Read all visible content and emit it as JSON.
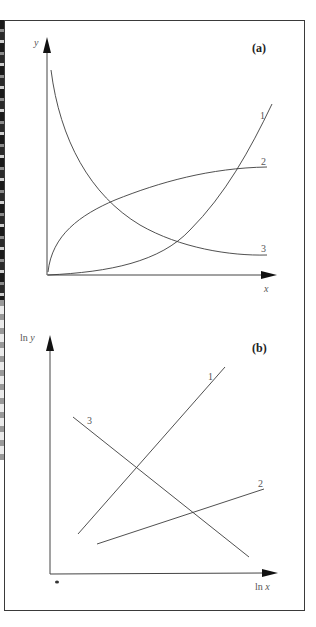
{
  "figure": {
    "panel_a": {
      "label": "(a)",
      "y_axis_label": "y",
      "x_axis_label": "x",
      "curves": [
        {
          "id": "1",
          "label": "1",
          "shape": "exponential growth (concave up)"
        },
        {
          "id": "2",
          "label": "2",
          "shape": "saturating growth (concave down, levels off)"
        },
        {
          "id": "3",
          "label": "3",
          "shape": "decay (concave up, decreasing)"
        }
      ]
    },
    "panel_b": {
      "label": "(b)",
      "y_axis_label": "ln y",
      "x_axis_label": "ln x",
      "lines": [
        {
          "id": "1",
          "label": "1",
          "slope": "steep positive"
        },
        {
          "id": "2",
          "label": "2",
          "slope": "shallow positive"
        },
        {
          "id": "3",
          "label": "3",
          "slope": "negative"
        }
      ]
    },
    "colors": {
      "stroke": "#3c3c3c",
      "frame": "#3a3a3a",
      "background": "#ffffff"
    }
  }
}
